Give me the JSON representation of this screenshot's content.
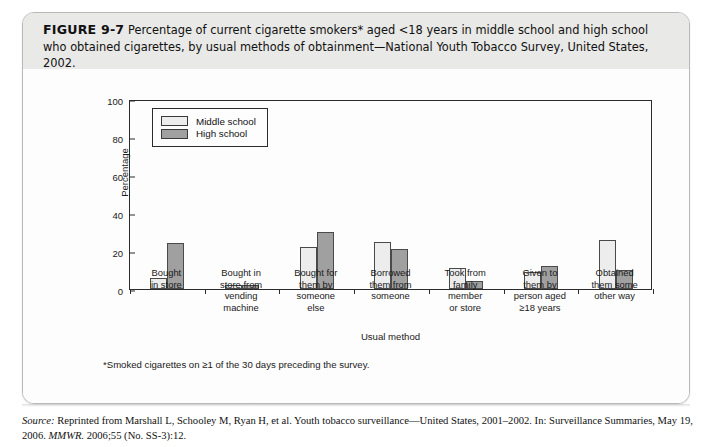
{
  "figure": {
    "label": "FIGURE 9-7",
    "caption": " Percentage of current cigarette smokers* aged <18 years in middle school and high school who obtained cigarettes, by usual methods of obtainment—National Youth Tobacco Survey, United States, 2002."
  },
  "footnote": "*Smoked cigarettes on ≥1 of the 30 days preceding the survey.",
  "source": {
    "label": "Source:",
    "text": " Reprinted from Marshall L, Schooley M, Ryan H, et al. Youth tobacco surveillance—United States, 2001–2002. In: Surveillance Summaries, May 19, 2006. ",
    "journal": "MMWR.",
    "citation": " 2006;55 (No. SS-3):12."
  },
  "colors": {
    "middle_school": "#ededed",
    "high_school": "#a0a0a0",
    "axis": "#2b2b2b",
    "caption_band": "#e9e9e7"
  },
  "chart_data": {
    "type": "bar",
    "title": "",
    "xlabel": "Usual method",
    "ylabel": "Percentage",
    "ylim": [
      0,
      100
    ],
    "yticks": [
      0,
      20,
      40,
      60,
      80,
      100
    ],
    "grid": false,
    "legend_position": "top-left",
    "categories": [
      "Bought\nin store",
      "Bought in\nstore from\nvending\nmachine",
      "Bought for\nthem by\nsomeone\nelse",
      "Borrowed\nthem from\nsomeone",
      "Took from\nfamily\nmember\nor store",
      "Given to\nthem by\nperson aged\n≥18 years",
      "Obtained\nthem some\nother way"
    ],
    "series": [
      {
        "name": "Middle school",
        "values": [
          6,
          2,
          22,
          25,
          11,
          9,
          26
        ]
      },
      {
        "name": "High school",
        "values": [
          24,
          2,
          30,
          21,
          4,
          12,
          10
        ]
      }
    ]
  }
}
